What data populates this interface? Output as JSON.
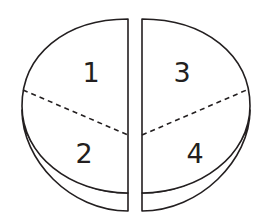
{
  "diagram": {
    "stroke_color": "#231f20",
    "background": "#ffffff",
    "quarters": [
      {
        "id": 1,
        "label": "1",
        "position": "upper-left"
      },
      {
        "id": 2,
        "label": "2",
        "position": "lower-left"
      },
      {
        "id": 3,
        "label": "3",
        "position": "upper-right"
      },
      {
        "id": 4,
        "label": "4",
        "position": "lower-right"
      }
    ]
  }
}
